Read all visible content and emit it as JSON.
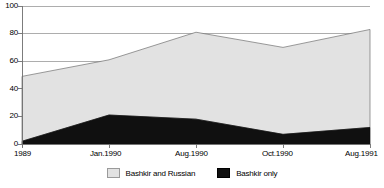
{
  "chart_data": {
    "type": "area",
    "title": "",
    "subtitle": "",
    "xlabel": "",
    "ylabel": "",
    "ylim": [
      0,
      100
    ],
    "yticks": [
      0,
      20,
      40,
      60,
      80,
      100
    ],
    "grid": true,
    "stacked": true,
    "legend_position": "bottom",
    "categories": [
      "1989",
      "Jan.1990",
      "Aug.1990",
      "Oct.1990",
      "Aug.1991"
    ],
    "series": [
      {
        "name": "Bashkir only",
        "color": "#101010",
        "values": [
          2,
          21,
          18,
          7,
          12
        ]
      },
      {
        "name": "Bashkir and Russian",
        "color": "#e2e2e2",
        "values": [
          47,
          40,
          63,
          63,
          71
        ]
      }
    ],
    "cumulative_top": [
      49,
      61,
      81,
      70,
      83
    ],
    "annotations": []
  },
  "axes": {
    "y_tick_labels": [
      "100",
      "80",
      "60",
      "40",
      "20",
      "0"
    ],
    "x_tick_labels": [
      "1989",
      "Jan.1990",
      "Aug.1990",
      "Oct.1990",
      "Aug.1991"
    ]
  },
  "legend": {
    "entries": [
      {
        "label": "Bashkir and Russian",
        "swatch": "light-gray-swatch"
      },
      {
        "label": "Bashkir only",
        "swatch": "black-swatch"
      }
    ]
  },
  "colors": {
    "area_gray": "#e2e2e2",
    "area_black": "#101010",
    "axis": "#6e6e6e",
    "grid": "#8a8a8a",
    "text": "#000000"
  }
}
